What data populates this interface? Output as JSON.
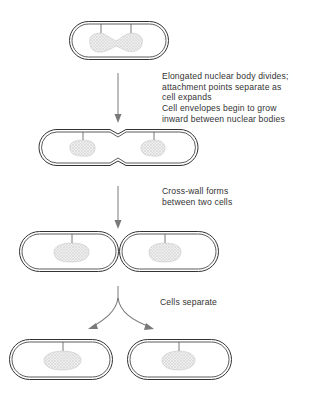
{
  "colors": {
    "outline": "#333333",
    "arrow": "#7a7a7a",
    "nucleoid_fill": "#e6e6e6",
    "nucleoid_stroke": "#b8b8b8",
    "text": "#333333"
  },
  "steps": [
    {
      "id": "step-1",
      "lines": [
        "Elongated nuclear body divides;",
        "attachment points separate as",
        "cell expands"
      ]
    },
    {
      "id": "step-2",
      "lines": [
        "Cell envelopes begin to grow",
        "inward between nuclear bodies"
      ]
    },
    {
      "id": "step-3",
      "lines": [
        "Cross-wall forms",
        "between two cells"
      ]
    },
    {
      "id": "step-4",
      "lines": [
        "Cells separate"
      ]
    }
  ],
  "stages": [
    {
      "name": "elongated-cell",
      "cells": 1,
      "nucleoids": 2
    },
    {
      "name": "constricting-cell",
      "cells": 1,
      "nucleoids": 2
    },
    {
      "name": "cross-wall-cells",
      "cells": 2,
      "nucleoids": 2
    },
    {
      "name": "separated-cells",
      "cells": 2,
      "nucleoids": 2
    }
  ]
}
